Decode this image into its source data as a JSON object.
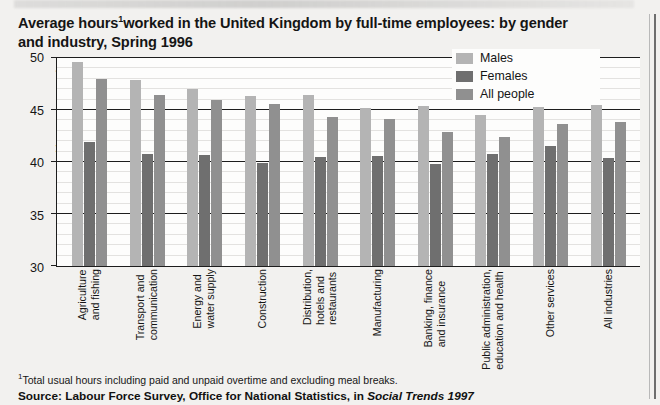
{
  "title": {
    "line1": "Average hours",
    "footnote_marker": "1",
    "line1b": "worked in the United Kingdom by full-time employees: by gender",
    "line2": "and industry, Spring 1996"
  },
  "footnote": {
    "marker": "1",
    "text": "Total usual hours including paid and unpaid overtime and excluding meal breaks."
  },
  "source": {
    "prefix": "Source: Labour Force Survey, Office for National Statistics, in ",
    "publication": "Social Trends 1997"
  },
  "legend": {
    "position": "top-right",
    "items": [
      {
        "label": "Males",
        "color": "#b4b4b4"
      },
      {
        "label": "Females",
        "color": "#6f6f6f"
      },
      {
        "label": "All people",
        "color": "#909090"
      }
    ]
  },
  "axis": {
    "y_label": "Hours per week",
    "y_ticks": [
      "50",
      "45",
      "40",
      "35",
      "30"
    ]
  },
  "chart_data": {
    "type": "bar",
    "xlabel": "",
    "ylabel": "Hours per week",
    "ylim": [
      30,
      50
    ],
    "yticks": [
      30,
      35,
      40,
      45,
      50
    ],
    "grid": true,
    "legend_position": "top-right",
    "categories": [
      "Agriculture and fishing",
      "Transport and communication",
      "Energy and water supply",
      "Construction",
      "Distribution, hotels and restaurants",
      "Manufacturing",
      "Banking, finance and insurance",
      "Public administration, education and health",
      "Other services",
      "All industries"
    ],
    "category_lines": [
      [
        "Agriculture",
        "and fishing"
      ],
      [
        "Transport and",
        "communication"
      ],
      [
        "Energy and",
        "water supply"
      ],
      [
        "Construction"
      ],
      [
        "Distribution,",
        "hotels and",
        "restaurants"
      ],
      [
        "Manufacturing"
      ],
      [
        "Banking, finance",
        "and insurance"
      ],
      [
        "Public administration,",
        "education and health"
      ],
      [
        "Other services"
      ],
      [
        "All industries"
      ]
    ],
    "series": [
      {
        "name": "Males",
        "color": "#b4b4b4",
        "values": [
          49.6,
          47.9,
          47.0,
          46.3,
          46.4,
          45.2,
          45.4,
          44.5,
          45.3,
          45.5
        ]
      },
      {
        "name": "Females",
        "color": "#6f6f6f",
        "values": [
          41.9,
          40.8,
          40.7,
          39.9,
          40.5,
          40.6,
          39.8,
          40.8,
          41.5,
          40.4
        ]
      },
      {
        "name": "All people",
        "color": "#909090",
        "values": [
          48.0,
          46.4,
          46.0,
          45.6,
          44.3,
          44.1,
          42.9,
          42.4,
          43.7,
          43.8
        ]
      }
    ]
  }
}
